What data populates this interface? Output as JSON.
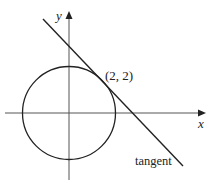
{
  "diagram": {
    "title": "",
    "axes": {
      "x_label": "x",
      "y_label": "y"
    },
    "circle": {
      "center": [
        0,
        0
      ],
      "radius_units": "2√2",
      "description": "circle centered at origin"
    },
    "point": {
      "label": "(2, 2)",
      "x": 2,
      "y": 2
    },
    "tangent": {
      "label": "tangent"
    },
    "colors": {
      "stroke": "#222222",
      "axis": "#555555",
      "background": "#ffffff"
    }
  }
}
